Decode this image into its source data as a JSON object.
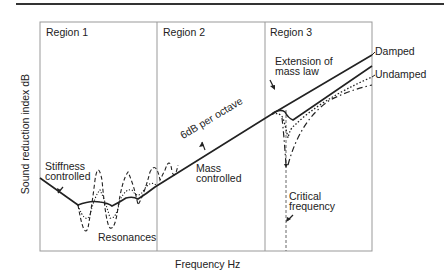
{
  "diagram": {
    "y_axis_label": "Sound reduction index dB",
    "x_axis_label": "Frequency Hz",
    "regions": [
      {
        "label": "Region 1"
      },
      {
        "label": "Region 2"
      },
      {
        "label": "Region 3"
      }
    ],
    "annotations": {
      "stiffness": [
        "Stiffness",
        "controlled"
      ],
      "resonances": "Resonances",
      "slope": "6dB per octave",
      "mass": [
        "Mass",
        "controlled"
      ],
      "extension": [
        "Extension of",
        "mass law"
      ],
      "damped": "Damped",
      "undamped": "Undamped",
      "critical": [
        "Critical",
        "frequency"
      ]
    },
    "colors": {
      "line": "#222222",
      "frame": "#888888"
    }
  }
}
